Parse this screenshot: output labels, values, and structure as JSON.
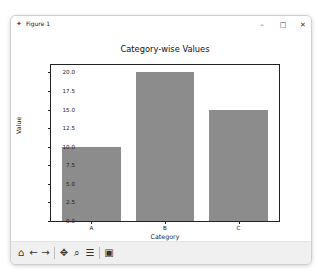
{
  "window": {
    "title": "Figure 1",
    "icon": "matplotlib-figure-icon",
    "controls": {
      "minimize": "–",
      "maximize": "□",
      "close": "✕"
    }
  },
  "toolbar": {
    "home": "⌂",
    "back": "←",
    "forward": "→",
    "pan": "✥",
    "zoom": "⌕",
    "configure": "☰",
    "save": "▣"
  },
  "colors": {
    "bar": "#8c8c8c",
    "axes": "#222222"
  },
  "chart_data": {
    "type": "bar",
    "title": "Category-wise Values",
    "xlabel": "Category",
    "ylabel": "Value",
    "categories": [
      "A",
      "B",
      "C"
    ],
    "values": [
      10,
      20,
      15
    ],
    "ylim": [
      0,
      21
    ],
    "yticks": [
      "0.0",
      "2.5",
      "5.0",
      "7.5",
      "10.0",
      "12.5",
      "15.0",
      "17.5",
      "20.0"
    ],
    "grid": false,
    "legend": null
  }
}
